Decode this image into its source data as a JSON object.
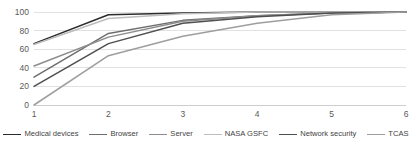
{
  "chart_data": {
    "type": "line",
    "title": "",
    "subtitle": "",
    "xlabel": "",
    "ylabel": "",
    "x": [
      1,
      2,
      3,
      4,
      5,
      6
    ],
    "xticklabels": [
      "1",
      "2",
      "3",
      "4",
      "5",
      "6"
    ],
    "yticklabels": [
      "0",
      "20",
      "40",
      "60",
      "80",
      "100"
    ],
    "yticks": [
      0,
      20,
      40,
      60,
      80,
      100
    ],
    "xlim": [
      1,
      6
    ],
    "ylim": [
      0,
      100
    ],
    "grid": "horizontal",
    "legend_position": "bottom",
    "series": [
      {
        "name": "Medical devices",
        "color": "#2b2b2b",
        "values": [
          66,
          97,
          99,
          100,
          100,
          100
        ]
      },
      {
        "name": "Browser",
        "color": "#6e6e6e",
        "values": [
          30,
          77,
          91,
          96,
          99,
          100
        ]
      },
      {
        "name": "Server",
        "color": "#8c8c8c",
        "values": [
          42,
          73,
          90,
          96,
          99,
          100
        ]
      },
      {
        "name": "NASA GSFC",
        "color": "#bdbdbd",
        "values": [
          65,
          93,
          98,
          100,
          100,
          100
        ]
      },
      {
        "name": "Network security",
        "color": "#4f4f4f",
        "values": [
          20,
          66,
          88,
          95,
          99,
          100
        ]
      },
      {
        "name": "TCAS",
        "color": "#9e9e9e",
        "values": [
          0,
          53,
          74,
          88,
          97,
          100
        ]
      }
    ]
  },
  "legend": {
    "items": [
      {
        "label": "Medical devices",
        "color": "#2b2b2b"
      },
      {
        "label": "Browser",
        "color": "#6e6e6e"
      },
      {
        "label": "Server",
        "color": "#8c8c8c"
      },
      {
        "label": "NASA GSFC",
        "color": "#bdbdbd"
      },
      {
        "label": "Network security",
        "color": "#4f4f4f"
      },
      {
        "label": "TCAS",
        "color": "#9e9e9e"
      }
    ]
  }
}
